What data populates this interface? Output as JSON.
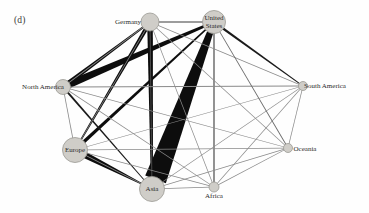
{
  "figure": {
    "panel_label": "(d)",
    "background_color": "#fefefe",
    "width": 369,
    "height": 213
  },
  "style": {
    "node_fill": "#cfcdc8",
    "node_stroke": "#9b9993",
    "edge_dark": "#0d0d0d",
    "edge_light": "#8a8a8a",
    "label_color": "#2b2b2b"
  },
  "chart_data": {
    "type": "network-diagram",
    "title": "(d)",
    "directed": true,
    "layout": "circular-force",
    "nodes": [
      {
        "id": "germany",
        "label": "Germany",
        "label_line2": "",
        "x": 150,
        "y": 22,
        "r": 9,
        "label_dx": -22,
        "label_dy": 0,
        "font_size": 7.0
      },
      {
        "id": "united_states",
        "label": "United",
        "label_line2": "States",
        "x": 214,
        "y": 22,
        "r": 11.5,
        "label_dx": 0,
        "label_dy": -4,
        "font_size": 7.0
      },
      {
        "id": "north_america",
        "label": "North America",
        "label_line2": "",
        "x": 63,
        "y": 87,
        "r": 7.5,
        "label_dx": -20,
        "label_dy": 0,
        "font_size": 7.0
      },
      {
        "id": "south_america",
        "label": "South America",
        "label_line2": "",
        "x": 303,
        "y": 86,
        "r": 4.5,
        "label_dx": 22,
        "label_dy": 0,
        "font_size": 7.0
      },
      {
        "id": "europe",
        "label": "Europe",
        "label_line2": "",
        "x": 75,
        "y": 150,
        "r": 12.5,
        "label_dx": 0,
        "label_dy": 0,
        "font_size": 7.0
      },
      {
        "id": "oceania",
        "label": "Oceania",
        "label_line2": "",
        "x": 288,
        "y": 148,
        "r": 4.5,
        "label_dx": 17,
        "label_dy": 1,
        "font_size": 7.0
      },
      {
        "id": "asia",
        "label": "Asia",
        "label_line2": "",
        "x": 152,
        "y": 189,
        "r": 12.5,
        "label_dx": 0,
        "label_dy": 0,
        "font_size": 7.0
      },
      {
        "id": "africa",
        "label": "Africa",
        "label_line2": "",
        "x": 214,
        "y": 187,
        "r": 5.0,
        "label_dx": 0,
        "label_dy": 9,
        "font_size": 7.0
      }
    ],
    "edges": [
      {
        "source": "asia",
        "target": "united_states",
        "weight": 22.0,
        "color": "#0d0d0d",
        "taper": 0.28
      },
      {
        "source": "north_america",
        "target": "united_states",
        "weight": 7.5,
        "color": "#0d0d0d",
        "taper": 0.35
      },
      {
        "source": "germany",
        "target": "asia",
        "weight": 5.5,
        "color": "#0d0d0d",
        "taper": 0.4
      },
      {
        "source": "north_america",
        "target": "germany",
        "weight": 4.5,
        "color": "#0d0d0d",
        "taper": 0.4
      },
      {
        "source": "europe",
        "target": "asia",
        "weight": 6.5,
        "color": "#0d0d0d",
        "taper": 0.25
      },
      {
        "source": "germany",
        "target": "europe",
        "weight": 4.0,
        "color": "#0d0d0d",
        "taper": 0.4
      },
      {
        "source": "europe",
        "target": "united_states",
        "weight": 3.5,
        "color": "#0d0d0d",
        "taper": 0.4
      },
      {
        "source": "united_states",
        "target": "south_america",
        "weight": 2.2,
        "color": "#1a1a1a",
        "taper": 0.45
      },
      {
        "source": "north_america",
        "target": "asia",
        "weight": 2.0,
        "color": "#1a1a1a",
        "taper": 0.45
      },
      {
        "source": "germany",
        "target": "united_states",
        "weight": 1.1,
        "color": "#3a3a3a",
        "taper": 1.0
      },
      {
        "source": "united_states",
        "target": "africa",
        "weight": 1.1,
        "color": "#3a3a3a",
        "taper": 1.0
      },
      {
        "source": "germany",
        "target": "asia",
        "weight": 1.0,
        "color": "#4a4a4a",
        "taper": 1.0
      },
      {
        "source": "north_america",
        "target": "south_america",
        "weight": 0.9,
        "color": "#8a8a8a",
        "taper": 1.0
      },
      {
        "source": "north_america",
        "target": "europe",
        "weight": 0.8,
        "color": "#8a8a8a",
        "taper": 1.0
      },
      {
        "source": "north_america",
        "target": "oceania",
        "weight": 0.7,
        "color": "#8a8a8a",
        "taper": 1.0
      },
      {
        "source": "north_america",
        "target": "africa",
        "weight": 0.7,
        "color": "#8a8a8a",
        "taper": 1.0
      },
      {
        "source": "europe",
        "target": "oceania",
        "weight": 0.7,
        "color": "#8a8a8a",
        "taper": 1.0
      },
      {
        "source": "europe",
        "target": "africa",
        "weight": 0.7,
        "color": "#8a8a8a",
        "taper": 1.0
      },
      {
        "source": "europe",
        "target": "south_america",
        "weight": 0.7,
        "color": "#8a8a8a",
        "taper": 1.0
      },
      {
        "source": "asia",
        "target": "africa",
        "weight": 0.8,
        "color": "#8a8a8a",
        "taper": 1.0
      },
      {
        "source": "asia",
        "target": "oceania",
        "weight": 0.8,
        "color": "#8a8a8a",
        "taper": 1.0
      },
      {
        "source": "asia",
        "target": "south_america",
        "weight": 0.7,
        "color": "#8a8a8a",
        "taper": 1.0
      },
      {
        "source": "africa",
        "target": "oceania",
        "weight": 0.7,
        "color": "#8a8a8a",
        "taper": 1.0
      },
      {
        "source": "africa",
        "target": "south_america",
        "weight": 0.7,
        "color": "#8a8a8a",
        "taper": 1.0
      },
      {
        "source": "oceania",
        "target": "south_america",
        "weight": 0.7,
        "color": "#8a8a8a",
        "taper": 1.0
      },
      {
        "source": "germany",
        "target": "south_america",
        "weight": 0.7,
        "color": "#8a8a8a",
        "taper": 1.0
      },
      {
        "source": "germany",
        "target": "oceania",
        "weight": 0.7,
        "color": "#8a8a8a",
        "taper": 1.0
      },
      {
        "source": "germany",
        "target": "africa",
        "weight": 0.7,
        "color": "#8a8a8a",
        "taper": 1.0
      },
      {
        "source": "united_states",
        "target": "oceania",
        "weight": 0.9,
        "color": "#6a6a6a",
        "taper": 1.0
      },
      {
        "source": "germany",
        "target": "north_america",
        "weight": 0.8,
        "color": "#8a8a8a",
        "taper": 1.0
      },
      {
        "source": "europe",
        "target": "germany",
        "weight": 0.8,
        "color": "#8a8a8a",
        "taper": 1.0
      },
      {
        "source": "asia",
        "target": "europe",
        "weight": 0.8,
        "color": "#8a8a8a",
        "taper": 1.0
      }
    ]
  }
}
